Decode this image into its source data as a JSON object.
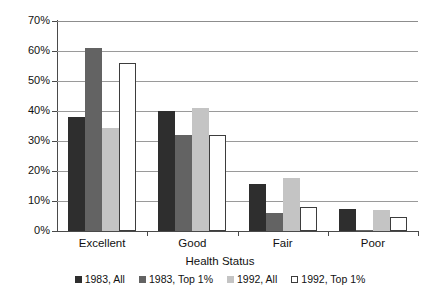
{
  "chart_data": {
    "type": "bar",
    "title": "",
    "xlabel": "Health Status",
    "ylabel": "",
    "categories": [
      "Excellent",
      "Good",
      "Fair",
      "Poor"
    ],
    "series": [
      {
        "name": "1983, All",
        "color": "#2e2e2e",
        "values": [
          38,
          40,
          15.7,
          7.3
        ]
      },
      {
        "name": "1983, Top 1%",
        "color": "#636363",
        "values": [
          61,
          32,
          6,
          0.5
        ]
      },
      {
        "name": "1992, All",
        "color": "#c4c4c4",
        "values": [
          34.5,
          41,
          17.7,
          7
        ]
      },
      {
        "name": "1992, Top 1%",
        "color": "#ffffff",
        "values": [
          56,
          32,
          8,
          4.7
        ]
      }
    ],
    "ylim": [
      0,
      70
    ],
    "ytick_values": [
      70,
      60,
      50,
      40,
      30,
      20,
      10,
      0
    ],
    "ytick_labels": [
      "70%",
      "60%",
      "50%",
      "40%",
      "30%",
      "20%",
      "10%",
      "0%"
    ],
    "grid": true,
    "legend_position": "bottom"
  }
}
